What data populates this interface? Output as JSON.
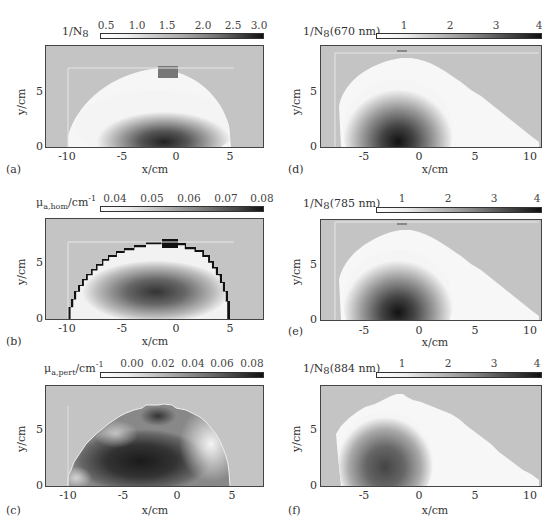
{
  "panels": [
    {
      "id": "a",
      "panel_label": "(a)",
      "colorbar_title": "1/N",
      "colorbar_title_sub": "8",
      "colorbar_ticks": [
        "0.5",
        "1.0",
        "1.5",
        "2.0",
        "2.5",
        "3.0"
      ],
      "x_label": "x/cm",
      "y_label": "y/cm",
      "x_ticks": [
        "-10",
        "-5",
        "0",
        "5"
      ],
      "y_ticks": [
        "0",
        "5"
      ]
    },
    {
      "id": "b",
      "panel_label": "(b)",
      "colorbar_title": "μ",
      "colorbar_title_sub": "a,hom",
      "colorbar_title_suffix": "/cm",
      "colorbar_title_sup": "-1",
      "colorbar_ticks": [
        "0.04",
        "0.05",
        "0.06",
        "0.07",
        "0.08"
      ],
      "x_label": "x/cm",
      "y_label": "y/cm",
      "x_ticks": [
        "-10",
        "-5",
        "0",
        "5"
      ],
      "y_ticks": [
        "0",
        "5"
      ]
    },
    {
      "id": "c",
      "panel_label": "(c)",
      "colorbar_title": "μ",
      "colorbar_title_sub": "a,pert",
      "colorbar_title_suffix": "/cm",
      "colorbar_title_sup": "-1",
      "colorbar_ticks": [
        "0.00",
        "0.02",
        "0.04",
        "0.06",
        "0.08"
      ],
      "x_label": "x/cm",
      "y_label": "y/cm",
      "x_ticks": [
        "-10",
        "-5",
        "0",
        "5"
      ],
      "y_ticks": [
        "0",
        "5"
      ]
    },
    {
      "id": "d",
      "panel_label": "(d)",
      "colorbar_title": "1/N",
      "colorbar_title_sub": "8",
      "colorbar_title_suffix": "(670 nm)",
      "colorbar_ticks": [
        "1",
        "2",
        "3",
        "4"
      ],
      "x_label": "x/cm",
      "y_label": "y/cm",
      "x_ticks": [
        "-5",
        "0",
        "5",
        "10"
      ],
      "y_ticks": [
        "0",
        "5"
      ]
    },
    {
      "id": "e",
      "panel_label": "(e)",
      "colorbar_title": "1/N",
      "colorbar_title_sub": "8",
      "colorbar_title_suffix": "(785 nm)",
      "colorbar_ticks": [
        "1",
        "2",
        "3",
        "4"
      ],
      "x_label": "x/cm",
      "y_label": "y/cm",
      "x_ticks": [
        "-5",
        "0",
        "5",
        "10"
      ],
      "y_ticks": [
        "0",
        "5"
      ]
    },
    {
      "id": "f",
      "panel_label": "(f)",
      "colorbar_title": "1/N",
      "colorbar_title_sub": "8",
      "colorbar_title_suffix": "(884 nm)",
      "colorbar_ticks": [
        "1",
        "2",
        "3",
        "4"
      ],
      "x_label": "x/cm",
      "y_label": "y/cm",
      "x_ticks": [
        "-5",
        "0",
        "5",
        "10"
      ],
      "y_ticks": [
        "0",
        "5"
      ]
    }
  ],
  "colors": {
    "background_region": "#c4c4c4",
    "low_value": "#ffffff",
    "high_value": "#111111",
    "frame": "#444444"
  }
}
